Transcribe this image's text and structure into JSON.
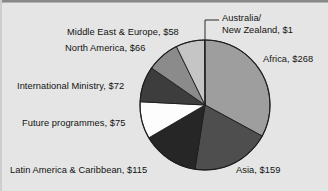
{
  "figure": {
    "background_color": "#e4e5e4",
    "text_color": "#131313",
    "currency_unit": "$",
    "note": "Pie chart of expenditure by region"
  },
  "chart_data": {
    "type": "pie",
    "title": "",
    "subtitle": "",
    "xlabel": "",
    "ylabel": "",
    "legend_position": "none",
    "labels_position": "outside-with-leader-lines",
    "grid": false,
    "total": 814,
    "categories": [
      "Africa",
      "Asia",
      "Latin America & Caribbean",
      "Future programmes",
      "International Ministry",
      "North America",
      "Middle East & Europe",
      "Australia/New Zealand"
    ],
    "values": [
      268,
      159,
      115,
      75,
      72,
      66,
      58,
      1
    ],
    "value_labels": [
      "Africa, $268",
      "Asia, $159",
      "Latin America & Caribbean, $115",
      "Future programmes, $75",
      "International Ministry, $72",
      "North America, $66",
      "Middle East & Europe, $58",
      "Australia/\nNew Zealand, $1"
    ],
    "slice_colors": [
      "#9d9e9d",
      "#4d4e4d",
      "#262626",
      "#fdfdfd",
      "#3c3d3c",
      "#8a8b8a",
      "#c4c5c4",
      "#b5b6b5"
    ],
    "slices": [
      {
        "name": "Africa",
        "value": 268,
        "label": "Africa, $268",
        "color": "#9d9e9d",
        "percent": 32.9
      },
      {
        "name": "Asia",
        "value": 159,
        "label": "Asia, $159",
        "color": "#4d4e4d",
        "percent": 19.5
      },
      {
        "name": "Latin America & Caribbean",
        "value": 115,
        "label": "Latin America & Caribbean, $115",
        "color": "#262626",
        "percent": 14.1
      },
      {
        "name": "Future programmes",
        "value": 75,
        "label": "Future programmes, $75",
        "color": "#fdfdfd",
        "percent": 9.2
      },
      {
        "name": "International Ministry",
        "value": 72,
        "label": "International Ministry, $72",
        "color": "#3c3d3c",
        "percent": 8.8
      },
      {
        "name": "North America",
        "value": 66,
        "label": "North America, $66",
        "color": "#8a8b8a",
        "percent": 8.1
      },
      {
        "name": "Middle East & Europe",
        "value": 58,
        "label": "Middle East & Europe, $58",
        "color": "#c4c5c4",
        "percent": 7.1
      },
      {
        "name": "Australia/New Zealand",
        "value": 1,
        "label": "Australia/ New Zealand, $1",
        "color": "#b5b6b5",
        "percent": 0.1
      }
    ]
  },
  "labels": {
    "australia_line1": "Australia/",
    "australia_line2": "New Zealand, $1",
    "africa": "Africa, $268",
    "asia": "Asia, $159",
    "latin_america": "Latin America & Caribbean, $115",
    "future_programmes": "Future programmes, $75",
    "international_ministry": "International Ministry, $72",
    "north_america": "North America, $66",
    "middle_east_europe": "Middle East & Europe, $58"
  }
}
